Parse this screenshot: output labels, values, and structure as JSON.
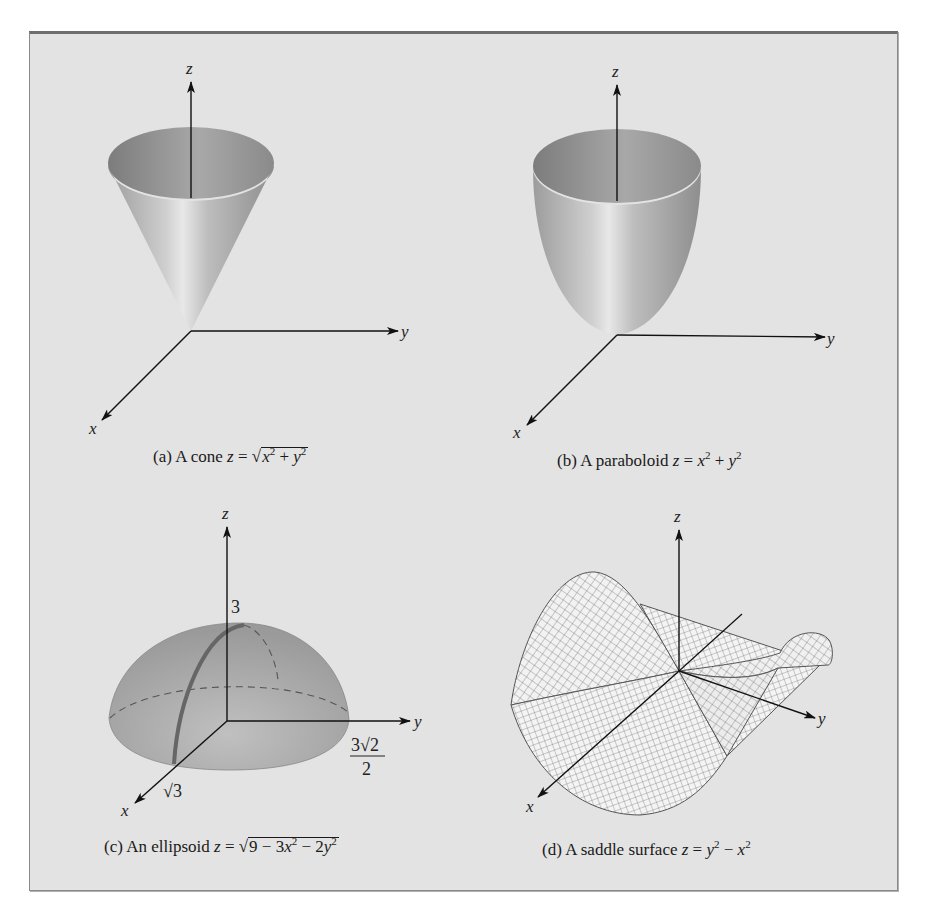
{
  "figure": {
    "background_color": "#e3e3e3",
    "border_color": "#6e6e6e",
    "panels": [
      {
        "id": "a",
        "caption_prefix": "(a) A cone ",
        "caption_lhs": "z",
        "caption_eq": " = ",
        "caption_rad_x": "x",
        "caption_rad_mid": " + ",
        "caption_rad_y": "y",
        "caption_exp": "2",
        "surface": "cone",
        "equation": "z = sqrt(x^2 + y^2)",
        "axes": {
          "x": "x",
          "y": "y",
          "z": "z"
        }
      },
      {
        "id": "b",
        "caption_prefix": "(b) A paraboloid ",
        "caption_lhs": "z",
        "caption_eq": " = ",
        "caption_x": "x",
        "caption_mid": " + ",
        "caption_y": "y",
        "caption_exp": "2",
        "surface": "paraboloid",
        "equation": "z = x^2 + y^2",
        "axes": {
          "x": "x",
          "y": "y",
          "z": "z"
        }
      },
      {
        "id": "c",
        "caption_prefix": "(c) An ellipsoid ",
        "caption_lhs": "z",
        "caption_eq": " = ",
        "caption_rad_a": "9 − 3",
        "caption_rad_x": "x",
        "caption_rad_b": " − 2",
        "caption_rad_y": "y",
        "caption_exp": "2",
        "surface": "ellipsoid",
        "equation": "z = sqrt(9 - 3x^2 - 2y^2)",
        "axes": {
          "x": "x",
          "y": "y",
          "z": "z"
        },
        "labels": {
          "z_intercept": "3",
          "x_intercept": "√3",
          "y_intercept_num": "3√2",
          "y_intercept_den": "2"
        }
      },
      {
        "id": "d",
        "caption_prefix": "(d) A saddle surface ",
        "caption_lhs": "z",
        "caption_eq": " = ",
        "caption_y": "y",
        "caption_mid": " − ",
        "caption_x": "x",
        "caption_exp": "2",
        "surface": "saddle",
        "equation": "z = y^2 - x^2",
        "axes": {
          "x": "x",
          "y": "y",
          "z": "z"
        }
      }
    ]
  }
}
